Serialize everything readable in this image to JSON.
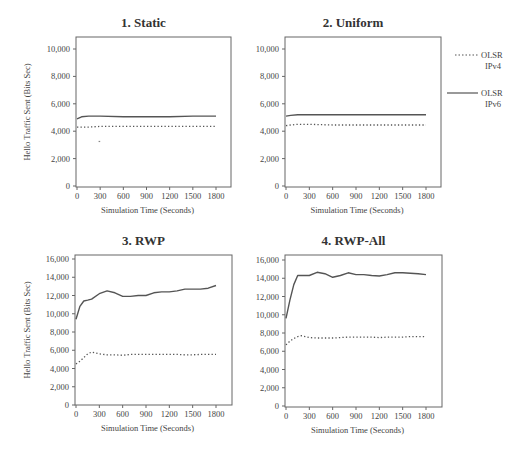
{
  "figure": {
    "legend": [
      {
        "label_line1": "OLSR",
        "label_line2": "IPv4",
        "style": "dotted"
      },
      {
        "label_line1": "OLSR",
        "label_line2": "IPv6",
        "style": "solid"
      }
    ],
    "line_color": "#555555"
  },
  "chart_data": [
    {
      "type": "line",
      "title": "1. Static",
      "xlabel": "Simulation Time (Seconds)",
      "ylabel": "Hello Traffic Sent (Bits Sec)",
      "x_ticks": [
        "0",
        "300",
        "600",
        "900",
        "1200",
        "1500",
        "1800"
      ],
      "y_ticks": [
        "0",
        "2,000",
        "4,000",
        "6,000",
        "8,000",
        "10,000"
      ],
      "ylim": [
        0,
        10000
      ],
      "xlim": [
        0,
        1800
      ],
      "x": [
        0,
        60,
        150,
        300,
        600,
        900,
        1200,
        1500,
        1800
      ],
      "series": [
        {
          "name": "OLSR IPv4",
          "values": [
            4300,
            4300,
            4300,
            4350,
            4350,
            4350,
            4350,
            4350,
            4350
          ]
        },
        {
          "name": "OLSR IPv6",
          "values": [
            4900,
            5050,
            5100,
            5100,
            5050,
            5050,
            5050,
            5100,
            5100
          ]
        }
      ],
      "annotations": [
        {
          "x": 290,
          "y": 3250,
          "note": "stray dot"
        }
      ]
    },
    {
      "type": "line",
      "title": "2. Uniform",
      "xlabel": "Simulation Time (Seconds)",
      "ylabel": "",
      "x_ticks": [
        "0",
        "300",
        "600",
        "900",
        "1200",
        "1500",
        "1800"
      ],
      "y_ticks": [
        "0",
        "2,000",
        "4,000",
        "6,000",
        "8,000",
        "10,000"
      ],
      "ylim": [
        0,
        10000
      ],
      "xlim": [
        0,
        1800
      ],
      "x": [
        0,
        60,
        150,
        300,
        600,
        900,
        1200,
        1500,
        1800
      ],
      "series": [
        {
          "name": "OLSR IPv4",
          "values": [
            4400,
            4450,
            4500,
            4500,
            4450,
            4450,
            4450,
            4450,
            4450
          ]
        },
        {
          "name": "OLSR IPv6",
          "values": [
            5100,
            5150,
            5200,
            5200,
            5200,
            5200,
            5200,
            5200,
            5200
          ]
        }
      ]
    },
    {
      "type": "line",
      "title": "3. RWP",
      "xlabel": "Simulation Time (Seconds)",
      "ylabel": "Hello Traffic Sent (Bits Sec)",
      "x_ticks": [
        "0",
        "300",
        "600",
        "900",
        "1200",
        "1500",
        "1800"
      ],
      "y_ticks": [
        "0",
        "2,000",
        "4,000",
        "6,000",
        "8,000",
        "10,000",
        "12,000",
        "14,000",
        "16,000"
      ],
      "ylim": [
        0,
        16000
      ],
      "xlim": [
        0,
        1800
      ],
      "x": [
        0,
        50,
        100,
        150,
        200,
        300,
        400,
        500,
        600,
        700,
        800,
        900,
        1000,
        1100,
        1200,
        1300,
        1400,
        1500,
        1600,
        1700,
        1800
      ],
      "series": [
        {
          "name": "OLSR IPv4",
          "values": [
            4500,
            4800,
            5200,
            5600,
            5800,
            5600,
            5500,
            5500,
            5450,
            5550,
            5550,
            5550,
            5550,
            5550,
            5550,
            5550,
            5500,
            5500,
            5550,
            5550,
            5550
          ]
        },
        {
          "name": "OLSR IPv6",
          "values": [
            9400,
            10800,
            11400,
            11500,
            11600,
            12200,
            12500,
            12300,
            11900,
            11900,
            12000,
            12000,
            12300,
            12400,
            12400,
            12500,
            12700,
            12700,
            12700,
            12800,
            13100
          ]
        }
      ]
    },
    {
      "type": "line",
      "title": "4. RWP-All",
      "xlabel": "Simulation Time (Seconds)",
      "ylabel": "",
      "x_ticks": [
        "0",
        "300",
        "600",
        "900",
        "1200",
        "1500",
        "1800"
      ],
      "y_ticks": [
        "0",
        "2,000",
        "4,000",
        "6,000",
        "8,000",
        "10,000",
        "12,000",
        "14,000",
        "16,000"
      ],
      "ylim": [
        0,
        16000
      ],
      "xlim": [
        0,
        1800
      ],
      "x": [
        0,
        50,
        100,
        150,
        200,
        300,
        400,
        500,
        600,
        700,
        800,
        900,
        1000,
        1100,
        1200,
        1300,
        1400,
        1500,
        1600,
        1700,
        1800
      ],
      "series": [
        {
          "name": "OLSR IPv4",
          "values": [
            6700,
            7100,
            7400,
            7600,
            7700,
            7500,
            7450,
            7450,
            7450,
            7500,
            7550,
            7550,
            7550,
            7550,
            7500,
            7550,
            7550,
            7550,
            7600,
            7600,
            7600
          ]
        },
        {
          "name": "OLSR IPv6",
          "values": [
            9600,
            11600,
            13300,
            14300,
            14300,
            14300,
            14650,
            14500,
            14100,
            14300,
            14600,
            14400,
            14400,
            14300,
            14250,
            14400,
            14600,
            14600,
            14550,
            14500,
            14400
          ]
        }
      ]
    }
  ]
}
